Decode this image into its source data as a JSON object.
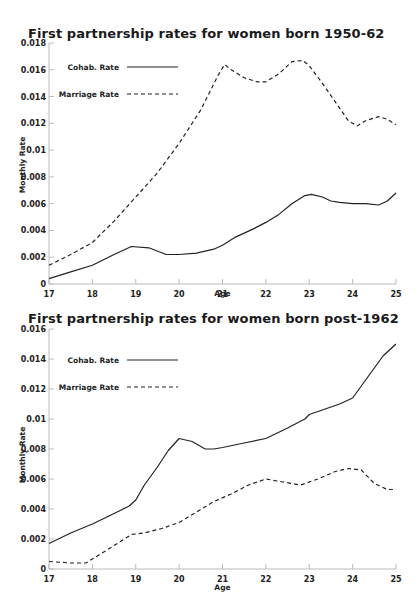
{
  "chart_data": [
    {
      "type": "line",
      "title": "First partnership rates for women born 1950-62",
      "xlabel": "Age",
      "ylabel": "Monthly Rate",
      "xlim": [
        17,
        25
      ],
      "ylim": [
        0,
        0.018
      ],
      "x_ticks": [
        "17",
        "18",
        "19",
        "20",
        "21",
        "22",
        "23",
        "24",
        "25"
      ],
      "y_ticks": [
        "0",
        "0.002",
        "0.004",
        "0.006",
        "0.008",
        "0.01",
        "0.012",
        "0.014",
        "0.016",
        "0.018"
      ],
      "legend": [
        {
          "label": "Cohab. Rate",
          "style": "solid"
        },
        {
          "label": "Marriage Rate",
          "style": "dashed"
        }
      ],
      "grid": false,
      "series": [
        {
          "name": "Cohab. Rate",
          "style": "solid",
          "x": [
            17,
            17.5,
            18,
            18.5,
            18.9,
            19.3,
            19.7,
            20,
            20.4,
            20.8,
            21,
            21.3,
            21.7,
            22,
            22.3,
            22.6,
            22.9,
            23.05,
            23.3,
            23.5,
            23.7,
            24,
            24.3,
            24.6,
            24.8,
            25
          ],
          "values": [
            0.0004,
            0.0009,
            0.0014,
            0.0022,
            0.0028,
            0.0027,
            0.0022,
            0.0022,
            0.0023,
            0.0026,
            0.0029,
            0.0035,
            0.0041,
            0.0046,
            0.0052,
            0.006,
            0.0066,
            0.0067,
            0.0065,
            0.0062,
            0.0061,
            0.006,
            0.006,
            0.0059,
            0.0062,
            0.0068
          ]
        },
        {
          "name": "Marriage Rate",
          "style": "dashed",
          "x": [
            17,
            17.5,
            18,
            18.5,
            19,
            19.5,
            20,
            20.5,
            20.9,
            21.05,
            21.2,
            21.5,
            21.8,
            22,
            22.3,
            22.6,
            22.85,
            23,
            23.3,
            23.6,
            23.9,
            24.1,
            24.3,
            24.6,
            24.8,
            25
          ],
          "values": [
            0.0014,
            0.0022,
            0.0031,
            0.0047,
            0.0065,
            0.0083,
            0.0105,
            0.013,
            0.0156,
            0.0164,
            0.016,
            0.0154,
            0.0151,
            0.0151,
            0.0157,
            0.0166,
            0.0167,
            0.0163,
            0.015,
            0.0136,
            0.0122,
            0.0118,
            0.0122,
            0.0125,
            0.0123,
            0.0119
          ]
        }
      ]
    },
    {
      "type": "line",
      "title": "First partnership rates for women born post-1962",
      "xlabel": "Age",
      "ylabel": "Monthly Rate",
      "xlim": [
        17,
        25
      ],
      "ylim": [
        0,
        0.016
      ],
      "x_ticks": [
        "17",
        "18",
        "19",
        "20",
        "21",
        "22",
        "23",
        "24",
        "25"
      ],
      "y_ticks": [
        "0",
        "0.002",
        "0.004",
        "0.006",
        "0.008",
        "0.01",
        "0.012",
        "0.014",
        "0.016"
      ],
      "legend": [
        {
          "label": "Cohab. Rate",
          "style": "solid"
        },
        {
          "label": "Marriage Rate",
          "style": "dashed"
        }
      ],
      "grid": false,
      "series": [
        {
          "name": "Cohab. Rate",
          "style": "solid",
          "x": [
            17,
            17.5,
            18,
            18.5,
            18.85,
            19,
            19.2,
            19.5,
            19.75,
            20,
            20.3,
            20.6,
            20.8,
            21,
            21.5,
            22,
            22.5,
            22.9,
            23,
            23.3,
            23.7,
            24,
            24.15,
            24.4,
            24.7,
            25
          ],
          "values": [
            0.0017,
            0.0024,
            0.003,
            0.0037,
            0.0042,
            0.0046,
            0.0056,
            0.0068,
            0.0079,
            0.0087,
            0.0085,
            0.008,
            0.008,
            0.0081,
            0.0084,
            0.0087,
            0.0094,
            0.01,
            0.0103,
            0.0106,
            0.011,
            0.0114,
            0.012,
            0.013,
            0.0142,
            0.015
          ]
        },
        {
          "name": "Marriage Rate",
          "style": "dashed",
          "x": [
            17,
            17.5,
            17.85,
            18.3,
            18.9,
            19.2,
            19.6,
            20,
            20.4,
            20.8,
            21.2,
            21.6,
            22,
            22.4,
            22.8,
            23.2,
            23.6,
            23.9,
            24.2,
            24.5,
            24.8,
            25
          ],
          "values": [
            0.0005,
            0.0004,
            0.0004,
            0.0012,
            0.0023,
            0.0024,
            0.0027,
            0.0031,
            0.0038,
            0.0045,
            0.005,
            0.0056,
            0.006,
            0.0058,
            0.0056,
            0.006,
            0.0065,
            0.0067,
            0.0066,
            0.0057,
            0.0053,
            0.0053
          ]
        }
      ]
    }
  ]
}
